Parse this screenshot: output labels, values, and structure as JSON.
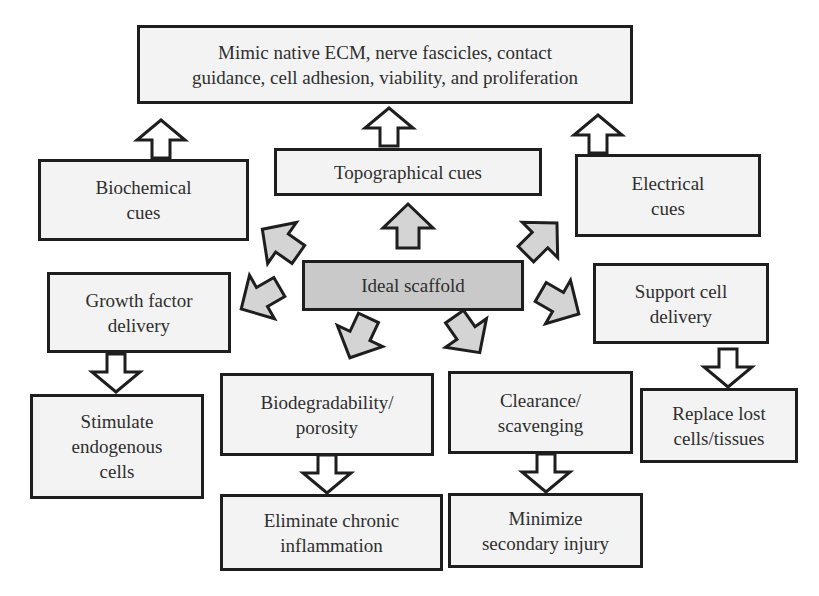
{
  "diagram": {
    "colors": {
      "box_fill": "#f3f3f3",
      "center_fill": "#c9c9c9",
      "border": "#1e1e1e",
      "arrow_fill_gray": "#d4d4d4",
      "arrow_fill_white": "#ffffff",
      "text": "#2e2e2e"
    },
    "nodes": {
      "outcome_top": "Mimic native ECM, nerve fascicles, contact\nguidance, cell adhesion, viability, and proliferation",
      "biochemical": "Biochemical\ncues",
      "topographical": "Topographical cues",
      "electrical": "Electrical\ncues",
      "center": "Ideal scaffold",
      "growth_factor": "Growth factor\ndelivery",
      "support_cell": "Support cell\ndelivery",
      "stimulate": "Stimulate\nendogenous\ncells",
      "biodegradability": "Biodegradability/\nporosity",
      "clearance": "Clearance/\nscavenging",
      "replace": "Replace lost\ncells/tissues",
      "eliminate": "Eliminate chronic\ninflammation",
      "minimize": "Minimize\nsecondary injury"
    },
    "edges": [
      {
        "from": "center",
        "to": "topographical",
        "style": "gray-block-arrow"
      },
      {
        "from": "center",
        "to": "biochemical",
        "style": "gray-block-arrow"
      },
      {
        "from": "center",
        "to": "electrical",
        "style": "gray-block-arrow"
      },
      {
        "from": "center",
        "to": "growth_factor",
        "style": "gray-block-arrow"
      },
      {
        "from": "center",
        "to": "support_cell",
        "style": "gray-block-arrow"
      },
      {
        "from": "center",
        "to": "biodegradability",
        "style": "gray-block-arrow"
      },
      {
        "from": "center",
        "to": "clearance",
        "style": "gray-block-arrow"
      },
      {
        "from": "biochemical",
        "to": "outcome_top",
        "style": "white-block-arrow"
      },
      {
        "from": "topographical",
        "to": "outcome_top",
        "style": "white-block-arrow"
      },
      {
        "from": "electrical",
        "to": "outcome_top",
        "style": "white-block-arrow"
      },
      {
        "from": "growth_factor",
        "to": "stimulate",
        "style": "white-block-arrow"
      },
      {
        "from": "support_cell",
        "to": "replace",
        "style": "white-block-arrow"
      },
      {
        "from": "biodegradability",
        "to": "eliminate",
        "style": "white-block-arrow"
      },
      {
        "from": "clearance",
        "to": "minimize",
        "style": "white-block-arrow"
      }
    ]
  }
}
